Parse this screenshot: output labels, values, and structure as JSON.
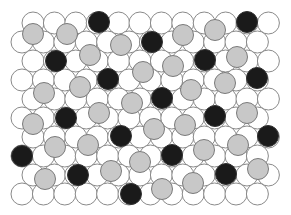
{
  "diagram": {
    "width": 291,
    "height": 215,
    "lattice": {
      "rows": [
        {
          "y": 23,
          "x_start": 33,
          "count": 12
        },
        {
          "y": 42,
          "x_start": 22,
          "count": 12
        },
        {
          "y": 61,
          "x_start": 33,
          "count": 12
        },
        {
          "y": 80,
          "x_start": 22,
          "count": 12
        },
        {
          "y": 99,
          "x_start": 33,
          "count": 12
        },
        {
          "y": 118,
          "x_start": 22,
          "count": 12
        },
        {
          "y": 137,
          "x_start": 33,
          "count": 12
        },
        {
          "y": 156,
          "x_start": 22,
          "count": 12
        },
        {
          "y": 175,
          "x_start": 33,
          "count": 12
        },
        {
          "y": 194,
          "x_start": 22,
          "count": 12
        }
      ],
      "spacing": 21.4,
      "radius": 11
    },
    "colors": {
      "white": "#ffffff",
      "gray": "#c8c8c8",
      "black": "#1a1a1a",
      "stroke": "#8a8a8a"
    },
    "gray_circles": {
      "radius": 10.5,
      "points": [
        [
          33,
          34
        ],
        [
          67,
          34
        ],
        [
          121,
          45
        ],
        [
          183,
          35
        ],
        [
          215,
          30
        ],
        [
          90,
          55
        ],
        [
          143,
          72
        ],
        [
          173,
          66
        ],
        [
          237,
          57
        ],
        [
          225,
          83
        ],
        [
          44,
          93
        ],
        [
          80,
          87
        ],
        [
          132,
          103
        ],
        [
          191,
          90
        ],
        [
          33,
          124
        ],
        [
          99,
          113
        ],
        [
          154,
          129
        ],
        [
          185,
          125
        ],
        [
          247,
          113
        ],
        [
          55,
          147
        ],
        [
          88,
          145
        ],
        [
          140,
          162
        ],
        [
          204,
          150
        ],
        [
          238,
          145
        ],
        [
          45,
          179
        ],
        [
          111,
          171
        ],
        [
          162,
          189
        ],
        [
          193,
          183
        ],
        [
          258,
          169
        ]
      ]
    },
    "black_circles": {
      "radius": 10.5,
      "points": [
        [
          99,
          22
        ],
        [
          247,
          22
        ],
        [
          152,
          42
        ],
        [
          56,
          61
        ],
        [
          205,
          60
        ],
        [
          108,
          79
        ],
        [
          257,
          78
        ],
        [
          162,
          98
        ],
        [
          66,
          118
        ],
        [
          215,
          116
        ],
        [
          121,
          136
        ],
        [
          268,
          136
        ],
        [
          22,
          156
        ],
        [
          172,
          155
        ],
        [
          78,
          175
        ],
        [
          226,
          174
        ],
        [
          131,
          194
        ]
      ]
    }
  }
}
